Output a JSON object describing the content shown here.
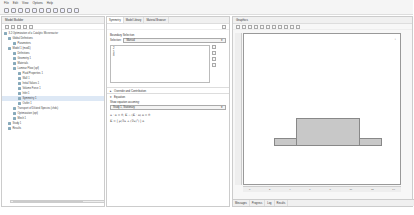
{
  "menubar": {
    "items": [
      "File",
      "Edit",
      "View",
      "Options",
      "Help"
    ]
  },
  "model_builder": {
    "title": "Model Builder",
    "tree": [
      {
        "label": "3.2 Optimization of a Catalytic Microreactor",
        "indent": 0
      },
      {
        "label": "Global Definitions",
        "indent": 1
      },
      {
        "label": "Parameters",
        "indent": 2
      },
      {
        "label": "Model 1 (mod1)",
        "indent": 1
      },
      {
        "label": "Definitions",
        "indent": 2
      },
      {
        "label": "Geometry 1",
        "indent": 2
      },
      {
        "label": "Materials",
        "indent": 2
      },
      {
        "label": "Laminar Flow (spf)",
        "indent": 2
      },
      {
        "label": "Fluid Properties 1",
        "indent": 3
      },
      {
        "label": "Wall 1",
        "indent": 3
      },
      {
        "label": "Initial Values 1",
        "indent": 3
      },
      {
        "label": "Volume Force 1",
        "indent": 3
      },
      {
        "label": "Inlet 1",
        "indent": 3
      },
      {
        "label": "Symmetry 1",
        "indent": 3,
        "selected": true
      },
      {
        "label": "Outlet 1",
        "indent": 3
      },
      {
        "label": "Transport of Diluted Species (chds)",
        "indent": 2
      },
      {
        "label": "Optimization (opt)",
        "indent": 2
      },
      {
        "label": "Mesh 1",
        "indent": 2
      },
      {
        "label": "Study 1",
        "indent": 1
      },
      {
        "label": "Results",
        "indent": 1
      }
    ]
  },
  "settings": {
    "tabs": [
      "Symmetry",
      "Model Library",
      "Material Browser"
    ],
    "boundary_selection": {
      "header": "Boundary Selection",
      "selection_label": "Selection:",
      "selection_value": "Manual",
      "list_items": [
        "2",
        "5",
        "8"
      ]
    },
    "override_header": "Override and Contribution",
    "equation_header": "Equation",
    "show_equation_label": "Show equation assuming:",
    "study_value": "Study 1, Stationary",
    "equation_line1": "u · n = 0,   K − (K · n) n = 0",
    "equation_line2": "K = [ μ(∇u + (∇u)ᵀ) ] n"
  },
  "graphics": {
    "title": "Graphics",
    "x_ticks": [
      "0",
      "2",
      "4",
      "6",
      "8",
      "10",
      "12",
      "14"
    ],
    "bottom_tabs": [
      "Messages",
      "Progress",
      "Log",
      "Results"
    ]
  }
}
